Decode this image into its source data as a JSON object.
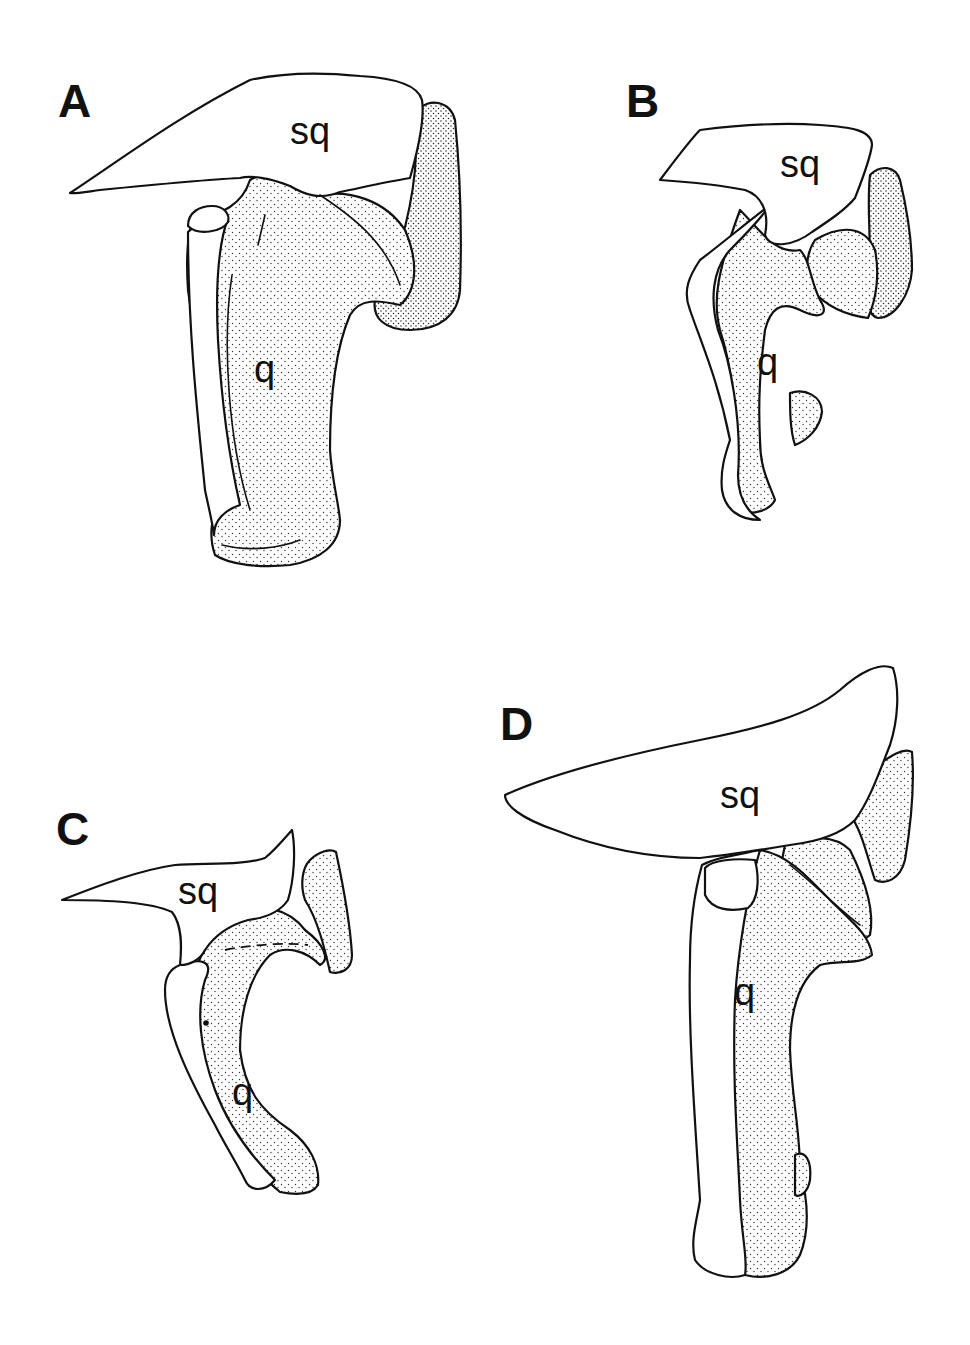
{
  "figure": {
    "type": "anatomical-illustration",
    "panels": [
      {
        "id": "A",
        "letter": "A",
        "labels": {
          "squamosal": "sq",
          "quadrate": "q"
        }
      },
      {
        "id": "B",
        "letter": "B",
        "labels": {
          "squamosal": "sq",
          "quadrate": "q"
        }
      },
      {
        "id": "C",
        "letter": "C",
        "labels": {
          "squamosal": "sq",
          "quadrate": "q"
        }
      },
      {
        "id": "D",
        "letter": "D",
        "labels": {
          "squamosal": "sq",
          "quadrate": "q"
        }
      }
    ]
  },
  "colors": {
    "ink": "#111111",
    "background": "#ffffff"
  }
}
